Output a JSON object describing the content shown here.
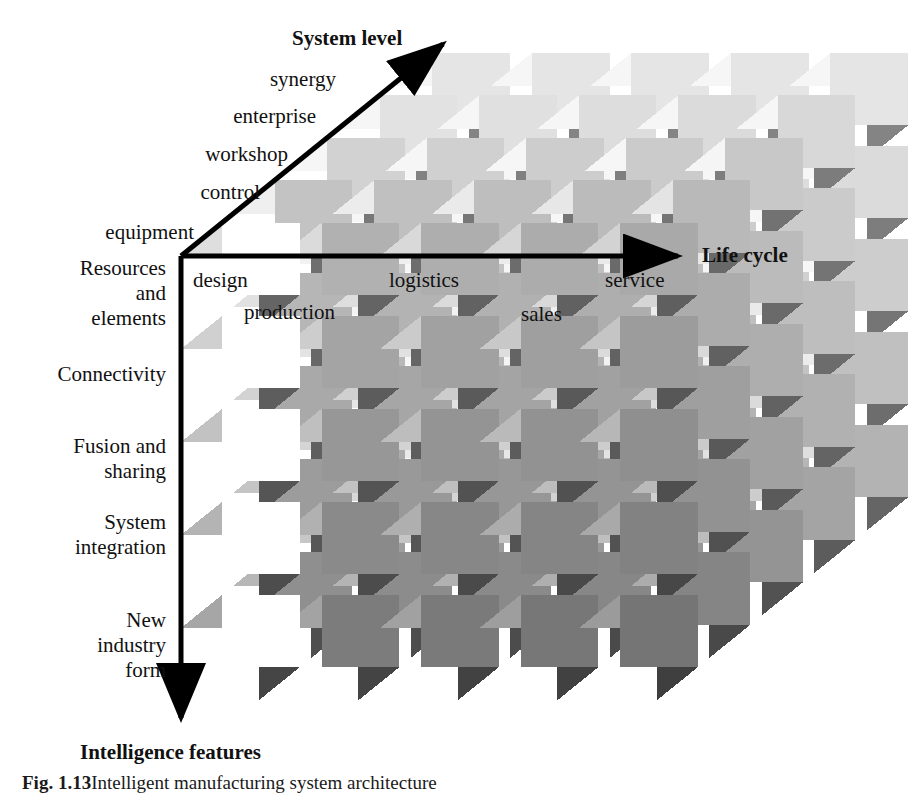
{
  "figure": {
    "title_axes": {
      "system_level": "System level",
      "life_cycle": "Life cycle",
      "intelligence_features": "Intelligence features"
    },
    "caption_label": "Fig. 1.13",
    "caption_text": "Intelligent manufacturing system architecture"
  },
  "axes": {
    "system_level": {
      "name": "System level",
      "direction": "up-right",
      "ticks": [
        "equipment",
        "control",
        "workshop",
        "enterprise",
        "synergy"
      ]
    },
    "life_cycle": {
      "name": "Life cycle",
      "direction": "right",
      "ticks": [
        "design",
        "production",
        "logistics",
        "sales",
        "service"
      ]
    },
    "intelligence_features": {
      "name": "Intelligence features",
      "direction": "down",
      "ticks": [
        "Resources\nand\nelements",
        "Connectivity",
        "Fusion and\nsharing",
        "System\nintegration",
        "New\nindustry\nform"
      ]
    }
  },
  "labels": {
    "system_level_title": "System level",
    "life_cycle_title": "Life cycle",
    "intelligence_features_title": "Intelligence features",
    "sl_synergy": "synergy",
    "sl_enterprise": "enterprise",
    "sl_workshop": "workshop",
    "sl_control": "control",
    "sl_equipment": "equipment",
    "lc_design": "design",
    "lc_production": "production",
    "lc_logistics": "logistics",
    "lc_sales": "sales",
    "lc_service": "service",
    "if_resources": "Resources\nand\nelements",
    "if_connectivity": "Connectivity",
    "if_fusion": "Fusion and\nsharing",
    "if_system_integration": "System\nintegration",
    "if_new_industry": "New\nindustry\nform"
  },
  "chart_data": {
    "type": "diagram-3d-matrix",
    "title": "Intelligent manufacturing system architecture",
    "dimensions": 3,
    "grid": [
      5,
      5,
      5
    ],
    "axis_x": {
      "label": "Life cycle",
      "categories": [
        "design",
        "production",
        "logistics",
        "sales",
        "service"
      ]
    },
    "axis_y": {
      "label": "Intelligence features",
      "categories": [
        "Resources and elements",
        "Connectivity",
        "Fusion and sharing",
        "System integration",
        "New industry form"
      ]
    },
    "axis_z": {
      "label": "System level",
      "categories": [
        "equipment",
        "control",
        "workshop",
        "enterprise",
        "synergy"
      ]
    }
  },
  "colors": {
    "front_light": "#c9c9c9",
    "front_mid": "#8e8e8e",
    "front_dark": "#5a5a5a",
    "top_light": "#d8d8d8",
    "top_mid": "#a8a8a8",
    "side_mid": "#7a7a7a",
    "axis": "#000000",
    "background": "#ffffff"
  }
}
